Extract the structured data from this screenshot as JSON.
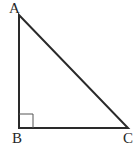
{
  "figure": {
    "kind": "geometry-diagram",
    "shape_name": "right-triangle",
    "width": 139,
    "height": 149,
    "background_color": "#ffffff",
    "stroke_color": "#2a2a2a",
    "stroke_width": 2,
    "marker_stroke_color": "#555555",
    "marker_stroke_width": 1,
    "label_color": "#262626"
  },
  "vertices": [
    {
      "id": "A",
      "label": "A",
      "x": 19,
      "y": 15,
      "label_x": 9,
      "label_y": 1,
      "role": "apex"
    },
    {
      "id": "B",
      "label": "B",
      "x": 19,
      "y": 128,
      "label_x": 12,
      "label_y": 131,
      "role": "right-angle"
    },
    {
      "id": "C",
      "label": "C",
      "x": 128,
      "y": 128,
      "label_x": 123,
      "label_y": 131,
      "role": "base-right"
    }
  ],
  "edges": [
    {
      "id": "AB",
      "from": "A",
      "to": "B",
      "name": "vertical-leg"
    },
    {
      "id": "BC",
      "from": "B",
      "to": "C",
      "name": "horizontal-leg"
    },
    {
      "id": "AC",
      "from": "A",
      "to": "C",
      "name": "hypotenuse"
    }
  ],
  "right_angle_marker": {
    "at_vertex": "B",
    "size": 14,
    "x": 19,
    "y": 128,
    "path": "M 19 114 L 33 114 L 33 128"
  },
  "paths": {
    "triangle": "M 19 15 L 19 128 L 128 128 Z"
  }
}
